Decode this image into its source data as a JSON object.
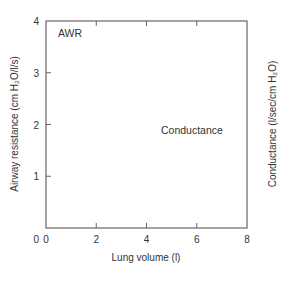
{
  "chart_data": {
    "type": "line",
    "title": "",
    "xlabel": "Lung volume (l)",
    "ylabel": "Airway resistance (cm H₂O/l/s)",
    "ylabel_right": "Conductance (l/sec/cm H₂O)",
    "xlim": [
      0,
      8
    ],
    "ylim": [
      0,
      4
    ],
    "ylim_right": [
      0,
      4
    ],
    "x_ticks": [
      0,
      2,
      4,
      6,
      8
    ],
    "y_ticks": [
      1,
      2,
      3,
      4
    ],
    "y_ticks_right": [
      1,
      2,
      3,
      4
    ],
    "grid": false,
    "legend": "none",
    "colors": {
      "axis": "#666666",
      "series": "#555555",
      "text": "#333333"
    },
    "series": [
      {
        "name": "AWR",
        "axis": "left",
        "style": "solid",
        "x": [
          1.63,
          1.8,
          2.0,
          2.3,
          2.6,
          3.0,
          3.4,
          3.8,
          4.3,
          4.8,
          5.3,
          5.8,
          6.3,
          6.97
        ],
        "y": [
          3.88,
          3.35,
          2.85,
          2.32,
          1.95,
          1.6,
          1.35,
          1.15,
          0.98,
          0.84,
          0.73,
          0.63,
          0.56,
          0.48
        ]
      },
      {
        "name": "Conductance",
        "axis": "right",
        "style": "dashed",
        "x": [
          1.6,
          6.93
        ],
        "y": [
          0.23,
          1.74
        ]
      }
    ],
    "annotations": [
      {
        "text": "AWR",
        "near": "top-left of AWR curve"
      },
      {
        "text": "Conductance",
        "near": "upper end of conductance line"
      }
    ]
  }
}
